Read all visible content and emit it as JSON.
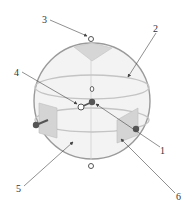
{
  "diagram": {
    "type": "labeled-schematic",
    "labels": [
      {
        "id": "1",
        "text": "1",
        "x": 162,
        "y": 152
      },
      {
        "id": "2",
        "text": "2",
        "x": 155,
        "y": 31
      },
      {
        "id": "3",
        "text": "3",
        "x": 43,
        "y": 24
      },
      {
        "id": "4",
        "text": "4",
        "x": 14,
        "y": 75
      },
      {
        "id": "5",
        "text": "5",
        "x": 17,
        "y": 191
      },
      {
        "id": "6",
        "text": "6",
        "x": 177,
        "y": 199
      }
    ],
    "colors": {
      "outline": "#9a9a9a",
      "fill": "#f2f2f2",
      "panel": "#d8d8d8",
      "dark_node": "#555555",
      "leader": "#444444"
    }
  }
}
